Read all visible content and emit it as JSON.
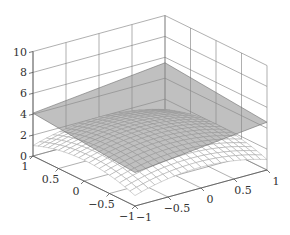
{
  "chart_data": {
    "type": "surface3d",
    "title": "",
    "xlabel": "",
    "ylabel": "",
    "zlabel": "",
    "xlim": [
      -1,
      1
    ],
    "ylim": [
      -1,
      1
    ],
    "zlim": [
      0,
      10
    ],
    "grid": true,
    "x_ticks": [
      "-1",
      "-0.5",
      "0",
      "0.5",
      "1"
    ],
    "y_ticks": [
      "1",
      "0.5",
      "0",
      "-0.5",
      "-1"
    ],
    "z_ticks": [
      "0",
      "2",
      "4",
      "6",
      "8",
      "10"
    ],
    "surface": {
      "description": "dome-shaped wireframe mesh, peak near center",
      "formula": "z = 3 - x^2 - y^2",
      "peak_z": 3,
      "corner_z": 1,
      "mesh_resolution": 21,
      "color": "#9a9a9a"
    },
    "plane": {
      "description": "nearly flat plane slightly above the surface peak, viewed almost edge-on",
      "z_at_left": 3.2,
      "z_at_right": 5.7,
      "color": "#6e6e6e"
    }
  },
  "colors": {
    "background": "#ffffff",
    "axes": "#555555",
    "text": "#333333"
  }
}
